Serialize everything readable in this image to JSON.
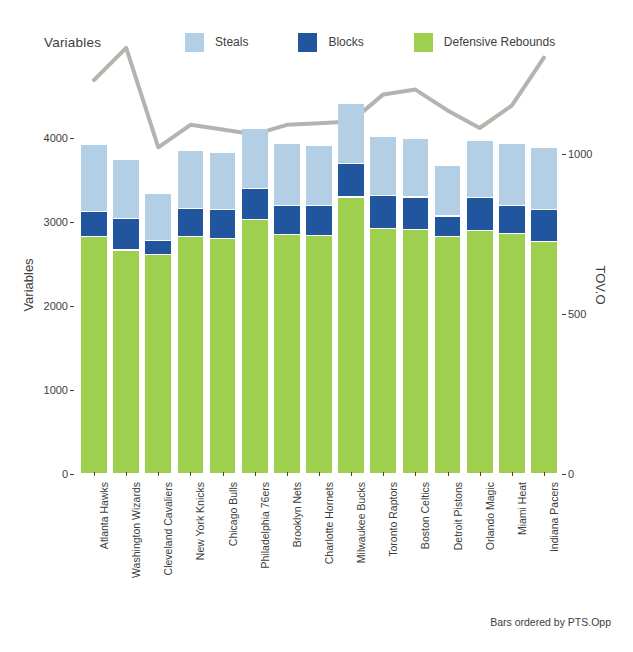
{
  "legend": {
    "title": "Variables",
    "items": [
      {
        "label": "Steals",
        "color": "#b3cfe6"
      },
      {
        "label": "Blocks",
        "color": "#21569e"
      },
      {
        "label": "Defensive Rebounds",
        "color": "#9fcf4f"
      }
    ]
  },
  "caption": "Bars ordered by PTS.Opp",
  "axes": {
    "left": {
      "title": "Variables",
      "ticks": [
        "0",
        "1000",
        "2000",
        "3000",
        "4000"
      ],
      "tick_values": [
        0,
        1000,
        2000,
        3000,
        4000
      ]
    },
    "right": {
      "title": "TOV.O",
      "ticks": [
        "0",
        "500",
        "1000"
      ],
      "tick_values": [
        0,
        500,
        1000
      ]
    }
  },
  "chart_data": {
    "type": "bar",
    "title": "",
    "subtitle": "",
    "xlabel": "",
    "ylabel": "Variables",
    "y2label": "TOV.O",
    "ylim": [
      0,
      4500
    ],
    "y2lim": [
      0,
      1180
    ],
    "grid": false,
    "legend_position": "top",
    "stacked": true,
    "annotation": "Bars ordered by PTS.Opp",
    "categories": [
      "Atlanta Hawks",
      "Washington Wizards",
      "Cleveland Cavaliers",
      "New York Knicks",
      "Chicago Bulls",
      "Philadelphia 76ers",
      "Brooklyn Nets",
      "Charlotte Hornets",
      "Milwaukee Bucks",
      "Toronto Raptors",
      "Boston Celtics",
      "Detroit Pistons",
      "Orlando Magic",
      "Miami Heat",
      "Indiana Pacers"
    ],
    "series": [
      {
        "name": "Defensive Rebounds",
        "color": "#9fcf4f",
        "values": [
          2820,
          2660,
          2610,
          2820,
          2800,
          3020,
          2840,
          2835,
          3290,
          2920,
          2900,
          2820,
          2890,
          2855,
          2760
        ]
      },
      {
        "name": "Blocks",
        "color": "#21569e",
        "values": [
          300,
          375,
          165,
          330,
          345,
          370,
          345,
          350,
          400,
          390,
          390,
          245,
          390,
          335,
          385
        ]
      },
      {
        "name": "Steals",
        "color": "#b3cfe6",
        "values": [
          800,
          700,
          555,
          700,
          680,
          715,
          740,
          720,
          720,
          700,
          695,
          600,
          680,
          740,
          740
        ]
      }
    ],
    "line_series": {
      "name": "TOV.O",
      "color": "#b5b3ad",
      "axis": "right",
      "values": [
        1230,
        1330,
        1020,
        1090,
        1075,
        1060,
        1090,
        1095,
        1100,
        1185,
        1200,
        1135,
        1080,
        1150,
        1300
      ]
    }
  }
}
